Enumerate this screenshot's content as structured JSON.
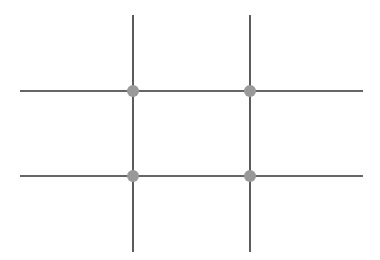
{
  "diagram": {
    "type": "rule-of-thirds-grid",
    "background": "#ffffff",
    "line_color": "#333333",
    "point_color": "#999999",
    "vertical_lines": [
      {
        "x": 133,
        "y1": 15,
        "y2": 252
      },
      {
        "x": 250,
        "y1": 15,
        "y2": 252
      }
    ],
    "horizontal_lines": [
      {
        "y": 91,
        "x1": 20,
        "x2": 363
      },
      {
        "y": 176,
        "x1": 20,
        "x2": 363
      }
    ],
    "intersection_points": [
      {
        "x": 133,
        "y": 91
      },
      {
        "x": 250,
        "y": 91
      },
      {
        "x": 133,
        "y": 176
      },
      {
        "x": 250,
        "y": 176
      }
    ]
  }
}
